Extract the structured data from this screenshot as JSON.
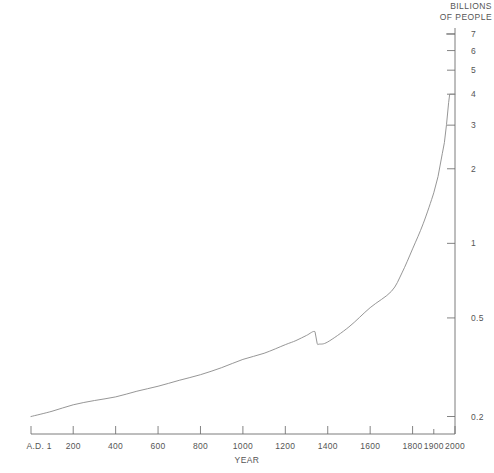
{
  "chart_data": {
    "type": "line",
    "title": "",
    "xlabel": "YEAR",
    "ylabel": "BILLIONS OF PEOPLE",
    "xscale": "linear",
    "yscale": "log",
    "grid": false,
    "legend": "none",
    "xlim": [
      1,
      2000
    ],
    "ylim": [
      0.17,
      7.4
    ],
    "x_tick_labels": [
      "A.D. 1",
      "200",
      "400",
      "600",
      "800",
      "1000",
      "1200",
      "1400",
      "1600",
      "1800",
      "1900",
      "2000"
    ],
    "x_tick_values": [
      1,
      200,
      400,
      600,
      800,
      1000,
      1200,
      1400,
      1600,
      1800,
      1900,
      2000
    ],
    "y_tick_labels": [
      "0.2",
      "0.5",
      "1",
      "2",
      "3",
      "4",
      "5",
      "6",
      "7"
    ],
    "y_tick_values": [
      0.2,
      0.5,
      1,
      2,
      3,
      4,
      5,
      6,
      7
    ],
    "series": [
      {
        "name": "World population",
        "units": "billions",
        "x": [
          1,
          100,
          200,
          300,
          400,
          500,
          600,
          700,
          800,
          900,
          1000,
          1100,
          1200,
          1250,
          1300,
          1340,
          1350,
          1360,
          1400,
          1500,
          1600,
          1700,
          1750,
          1800,
          1850,
          1900,
          1920,
          1940,
          1950,
          1960,
          1970,
          1975
        ],
        "values": [
          0.2,
          0.21,
          0.223,
          0.232,
          0.24,
          0.253,
          0.265,
          0.28,
          0.295,
          0.315,
          0.34,
          0.36,
          0.39,
          0.405,
          0.425,
          0.44,
          0.395,
          0.392,
          0.4,
          0.46,
          0.55,
          0.64,
          0.76,
          0.95,
          1.2,
          1.6,
          1.86,
          2.3,
          2.55,
          3.02,
          3.7,
          4.0
        ]
      }
    ],
    "annotations": [
      {
        "label": "plague decline",
        "x": 1345,
        "y": 0.43
      }
    ]
  },
  "canvas": {
    "width": 494,
    "height": 473,
    "background": "#ffffff",
    "line_color": "#8a8a8a",
    "axis_color": "#6e6e6e",
    "text_color": "#555555"
  }
}
